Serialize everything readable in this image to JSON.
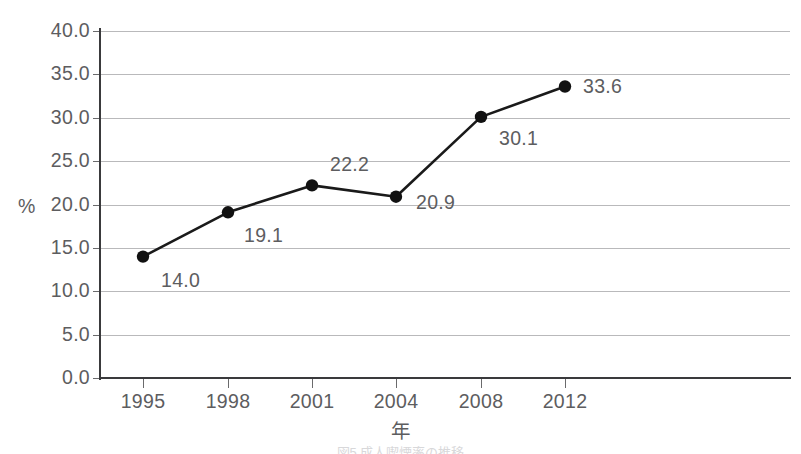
{
  "chart_data": {
    "type": "line",
    "title": "",
    "subtitle": "",
    "xlabel": "年",
    "ylabel": "%",
    "categories": [
      "1995",
      "1998",
      "2001",
      "2004",
      "2008",
      "2012"
    ],
    "values": [
      14.0,
      19.1,
      22.2,
      20.9,
      30.1,
      33.6
    ],
    "point_labels": [
      "14.0",
      "19.1",
      "22.2",
      "20.9",
      "30.1",
      "33.6"
    ],
    "series": [
      {
        "name": "",
        "values": [
          14.0,
          19.1,
          22.2,
          20.9,
          30.1,
          33.6
        ]
      }
    ],
    "ylim": [
      0.0,
      40.0
    ],
    "ytick_step": 5.0,
    "ytick_labels": [
      "40.0",
      "35.0",
      "30.0",
      "25.0",
      "20.0",
      "15.0",
      "10.0",
      "5.0",
      "0.0"
    ],
    "ytick_values": [
      40.0,
      35.0,
      30.0,
      25.0,
      20.0,
      15.0,
      10.0,
      5.0,
      0.0
    ],
    "xtick_labels": [
      "1995",
      "1998",
      "2001",
      "2004",
      "2008",
      "2012"
    ],
    "grid": "horizontal",
    "legend": "none",
    "marker": "filled-circle",
    "line_color": "#1a1a1a",
    "marker_color": "#111111",
    "grid_color": "#b9b9bb",
    "axis_color": "#3a3a3c",
    "text_color": "#5d5d5f",
    "background": "#ffffff"
  },
  "caption": {
    "ghost_text": "図5 成人喫煙率の推移"
  }
}
